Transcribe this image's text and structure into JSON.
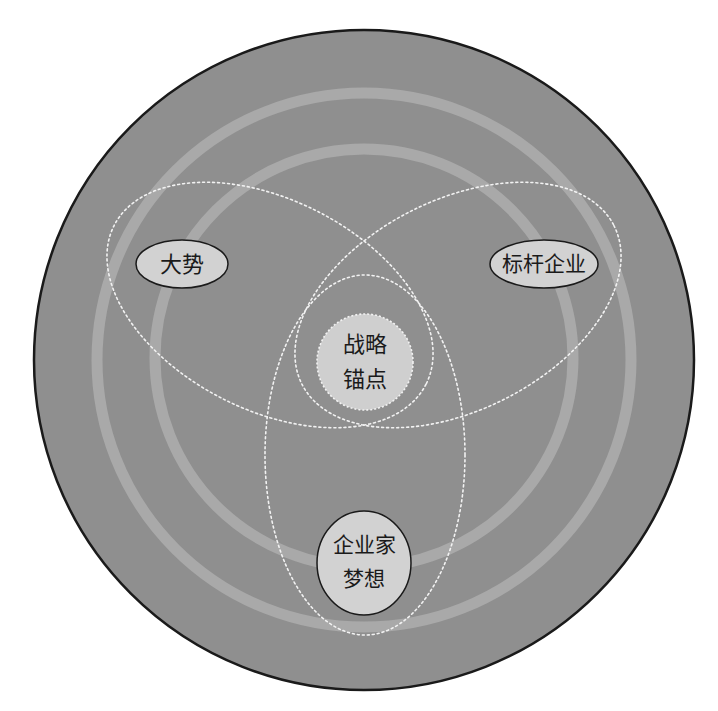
{
  "diagram": {
    "title": "",
    "colors": {
      "background": "#ffffff",
      "outer_disc": "#8f8f8f",
      "outer_disc_border": "#1a1a1a",
      "rings": "#a9a9a9",
      "dotted_lines": "#f2f2f2",
      "node_fill": "#d2d2d2",
      "center_fill": "#cfcfcf",
      "node_border": "#1a1a1a",
      "text": "#1a1a1a"
    },
    "nodes": {
      "trend": {
        "label": "大势"
      },
      "benchmark": {
        "label": "标杆企业"
      },
      "center": {
        "line1": "战略",
        "line2": "锚点"
      },
      "dream": {
        "line1": "企业家",
        "line2": "梦想"
      }
    },
    "caption": ""
  }
}
